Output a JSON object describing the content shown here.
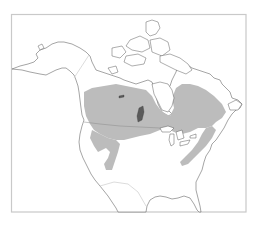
{
  "map": {
    "title": "",
    "region": "North America",
    "layers": {
      "range": {
        "name": "species-range",
        "color": "#bcbcbc"
      },
      "land": {
        "color": "#ffffff",
        "outline": "#4a4a4a"
      },
      "frame": {
        "color": "#c9c9c9"
      },
      "borders": {
        "international": "#8a8a8a",
        "faint": "#d8d8d8"
      }
    },
    "range_regions": [
      "boreal-canada",
      "western-us-lobe",
      "appalachian-band"
    ],
    "labels": []
  }
}
